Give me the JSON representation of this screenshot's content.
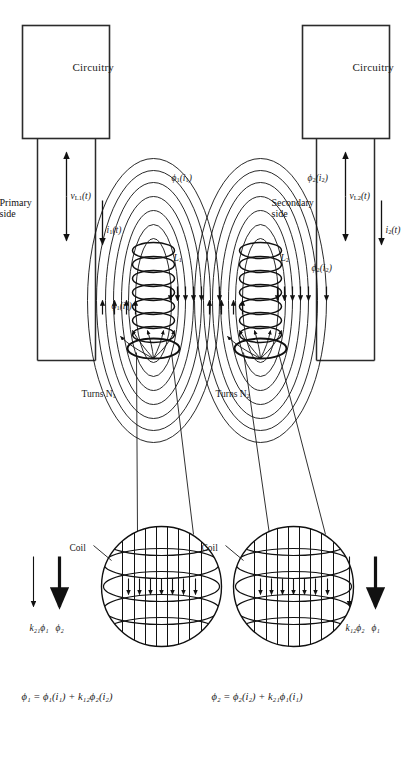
{
  "figure": {
    "boxes": [
      {
        "id": "secondary-circuitry",
        "label": "Circuitry"
      },
      {
        "id": "primary-circuitry",
        "label": "Circuitry"
      }
    ],
    "side_labels": {
      "secondary": "Secondary\nside",
      "secondary_line1": "Secondary",
      "secondary_line2": "side",
      "primary": "Primary\nside",
      "primary_line1": "Primary",
      "primary_line2": "side"
    },
    "turns": {
      "secondary": "Turns N",
      "secondary_sub": "2",
      "primary": "Turns N",
      "primary_sub": "1"
    },
    "coils": {
      "secondary_inductor": "L",
      "secondary_inductor_sub": "2",
      "primary_inductor": "L",
      "primary_inductor_sub": "1"
    },
    "currents": {
      "secondary_current": "i",
      "secondary_current_sub": "2",
      "secondary_current_arg": "(t)",
      "primary_current": "i",
      "primary_current_sub": "1",
      "primary_current_arg": "(t)"
    },
    "voltages": {
      "secondary_voltage": "v",
      "secondary_voltage_sub": "L2",
      "secondary_voltage_arg": "(t)",
      "primary_voltage": "v",
      "primary_voltage_sub": "L1",
      "primary_voltage_arg": "(t)"
    },
    "flux_labels": {
      "phi2_total": "ϕ",
      "phi2_total_sub": "2",
      "phi2_total_arg": "(t",
      "phi2_self": "ϕ",
      "phi2_self_sub": "2",
      "phi2_self_arg": "(i",
      "phi2_self_arg_sub": "2",
      "phi2_self_close": ")",
      "phi1_total": "ϕ",
      "phi1_total_sub": "1",
      "phi1_self": "ϕ",
      "phi1_self_sub": "1",
      "phi1_self_arg": "(i",
      "phi1_self_arg_sub": "1",
      "phi1_self_close": ")"
    },
    "magnified": {
      "secondary_callout": "Coil",
      "primary_callout": "Coil"
    },
    "equations": {
      "secondary": "ϕ₂ = ϕ₂(i₂) + k₂₁ϕ₁(i₁)",
      "primary": "ϕ₁ = ϕ₁(i₁) + k₁₂ϕ₂(i₂)"
    },
    "legend_top": {
      "thick_arrow_label": "ϕ₂",
      "thin_arrow_label": "k₂₁ϕ₁"
    },
    "legend_bottom": {
      "thick_arrow_label": "ϕ₁",
      "thin_arrow_label": "k₁₂ϕ₂"
    },
    "colors": {
      "ink": "#111111",
      "paper": "#ffffff",
      "line": "#1a1a1a"
    }
  }
}
